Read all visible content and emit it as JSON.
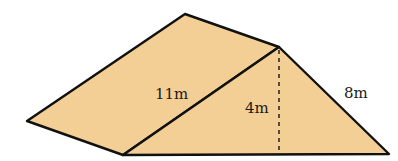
{
  "diagram": {
    "type": "triangular-prism",
    "colors": {
      "fill": "#F3CF95",
      "stroke": "#111111",
      "background": "#ffffff"
    },
    "vertices": {
      "back_apex": [
        185,
        14
      ],
      "front_apex": [
        279,
        47
      ],
      "left_corner": [
        27,
        121
      ],
      "front_bottom_left": [
        123,
        155
      ],
      "bottom_right": [
        389,
        154
      ],
      "height_foot": [
        279,
        155
      ]
    },
    "labels": {
      "slant_length": "11m",
      "height": "4m",
      "side": "8m"
    }
  }
}
